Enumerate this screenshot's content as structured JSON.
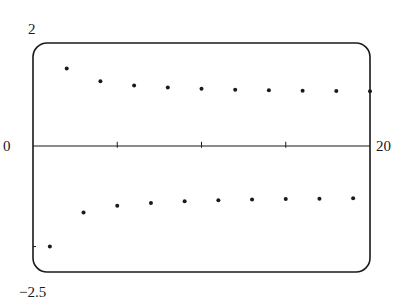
{
  "chart_data": {
    "type": "scatter",
    "title": "",
    "xlabel": "",
    "ylabel": "",
    "xlim": [
      0,
      20
    ],
    "ylim": [
      -2.5,
      2
    ],
    "x_ticks": [
      5,
      10,
      15
    ],
    "tick_labels": {
      "ymax": "2",
      "ymin": "-2.5",
      "xmin": "0",
      "xmax": "20"
    },
    "grid": false,
    "legend": null,
    "series": [
      {
        "name": "a_n = (-1)^n (1 + 1/n)",
        "x": [
          1,
          2,
          3,
          4,
          5,
          6,
          7,
          8,
          9,
          10,
          11,
          12,
          13,
          14,
          15,
          16,
          17,
          18,
          19,
          20
        ],
        "y": [
          -2.0,
          1.5,
          -1.333,
          1.25,
          -1.2,
          1.167,
          -1.143,
          1.125,
          -1.111,
          1.1,
          -1.091,
          1.083,
          -1.077,
          1.071,
          -1.067,
          1.063,
          -1.059,
          1.056,
          -1.053,
          1.05
        ]
      }
    ]
  },
  "labels": {
    "y_top": "2",
    "y_bottom": "−2.5",
    "x_left": "0",
    "x_right": "20"
  },
  "colors": {
    "ink": "#1a1a1a",
    "background": "#ffffff"
  }
}
